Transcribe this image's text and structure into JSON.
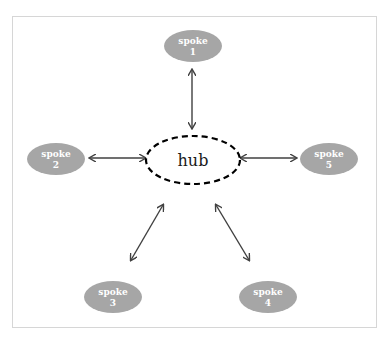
{
  "diagram": {
    "type": "hub-and-spoke",
    "colors": {
      "spoke_fill": "#a6a6a6",
      "spoke_text": "#ffffff",
      "hub_stroke": "#000000",
      "arrow": "#404040",
      "frame": "#d6d6d6"
    },
    "hub": {
      "label": "hub"
    },
    "spokes": [
      {
        "line1": "spoke",
        "line2": "1"
      },
      {
        "line1": "spoke",
        "line2": "2"
      },
      {
        "line1": "spoke",
        "line2": "3"
      },
      {
        "line1": "spoke",
        "line2": "4"
      },
      {
        "line1": "spoke",
        "line2": "5"
      }
    ],
    "connections": [
      {
        "from": "spoke 1",
        "to": "hub",
        "type": "bidirectional"
      },
      {
        "from": "spoke 2",
        "to": "hub",
        "type": "bidirectional"
      },
      {
        "from": "spoke 3",
        "to": "hub",
        "type": "bidirectional"
      },
      {
        "from": "spoke 4",
        "to": "hub",
        "type": "bidirectional"
      },
      {
        "from": "spoke 5",
        "to": "hub",
        "type": "bidirectional"
      }
    ]
  }
}
